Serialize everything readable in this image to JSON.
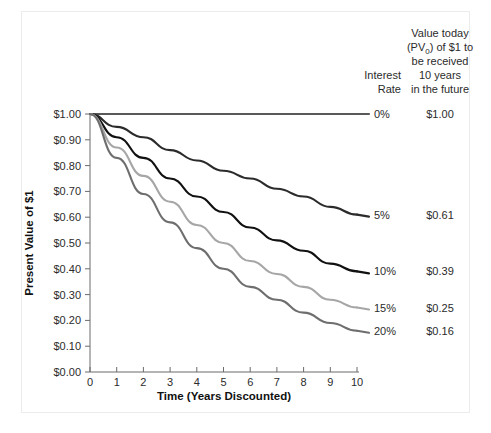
{
  "chart_data": {
    "type": "line",
    "title": "",
    "xlabel": "Time (Years Discounted)",
    "ylabel": "Present Value of $1",
    "x": [
      0,
      1,
      2,
      3,
      4,
      5,
      6,
      7,
      8,
      9,
      10
    ],
    "xlim": [
      0,
      10
    ],
    "ylim": [
      0.0,
      1.0
    ],
    "grid": false,
    "legend_position": "right",
    "xtick_labels": [
      "0",
      "1",
      "2",
      "3",
      "4",
      "5",
      "6",
      "7",
      "8",
      "9",
      "10"
    ],
    "ytick_labels": [
      "$0.00",
      "$0.10",
      "$0.20",
      "$0.30",
      "$0.40",
      "$0.50",
      "$0.60",
      "$0.70",
      "$0.80",
      "$0.90",
      "$1.00"
    ],
    "ytick_values": [
      0.0,
      0.1,
      0.2,
      0.3,
      0.4,
      0.5,
      0.6,
      0.7,
      0.8,
      0.9,
      1.0
    ],
    "series": [
      {
        "name": "0%",
        "rate": 0,
        "color": "#595959",
        "values": [
          1.0,
          1.0,
          1.0,
          1.0,
          1.0,
          1.0,
          1.0,
          1.0,
          1.0,
          1.0,
          1.0
        ]
      },
      {
        "name": "5%",
        "rate": 5,
        "color": "#2b2b2b",
        "values": [
          1.0,
          0.95,
          0.91,
          0.86,
          0.82,
          0.78,
          0.75,
          0.71,
          0.68,
          0.64,
          0.61
        ]
      },
      {
        "name": "10%",
        "rate": 10,
        "color": "#111111",
        "values": [
          1.0,
          0.91,
          0.83,
          0.75,
          0.68,
          0.62,
          0.56,
          0.51,
          0.47,
          0.42,
          0.39
        ]
      },
      {
        "name": "15%",
        "rate": 15,
        "color": "#a6a6a6",
        "values": [
          1.0,
          0.87,
          0.76,
          0.66,
          0.57,
          0.5,
          0.43,
          0.38,
          0.33,
          0.28,
          0.25
        ]
      },
      {
        "name": "20%",
        "rate": 20,
        "color": "#6e6e6e",
        "values": [
          1.0,
          0.83,
          0.69,
          0.58,
          0.48,
          0.4,
          0.33,
          0.28,
          0.23,
          0.19,
          0.16
        ]
      }
    ]
  },
  "legend": {
    "header_rate_line1": "Interest",
    "header_rate_line2": "Rate",
    "header_value_line1": "Value today",
    "header_value_line2_a": "(PV",
    "header_value_line2_sub": "0",
    "header_value_line2_b": ") of $1 to",
    "header_value_line3": "be received",
    "header_value_line4": "10 years",
    "header_value_line5": "in the future",
    "rows": [
      {
        "rate": "0%",
        "value": "$1.00"
      },
      {
        "rate": "5%",
        "value": "$0.61"
      },
      {
        "rate": "10%",
        "value": "$0.39"
      },
      {
        "rate": "15%",
        "value": "$0.25"
      },
      {
        "rate": "20%",
        "value": "$0.16"
      }
    ]
  },
  "axes": {
    "y_title": "Present Value of $1",
    "x_title": "Time (Years Discounted)"
  },
  "colors": {
    "axis": "#6b6b6b",
    "text": "#2b2b2b",
    "border": "#ececec"
  }
}
